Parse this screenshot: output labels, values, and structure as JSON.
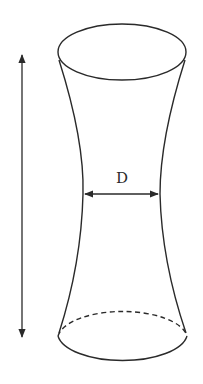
{
  "diagram": {
    "type": "hyperboloid-tube",
    "labels": {
      "waist_diameter": "D"
    },
    "colors": {
      "stroke": "#2a2a2a",
      "background": "#ffffff"
    },
    "shape": {
      "top_ellipse": {
        "cx": 122,
        "cy": 52,
        "rx": 64,
        "ry": 28
      },
      "bottom_ellipse": {
        "cx": 122,
        "cy": 338,
        "rx": 65,
        "ry": 28,
        "back_half": "dashed"
      },
      "waist": {
        "y": 194,
        "x_left": 83,
        "x_right": 160
      }
    },
    "arrows": {
      "height_arrow": {
        "x": 22,
        "y_top": 55,
        "y_bottom": 337,
        "direction": "double"
      },
      "diameter_arrow": {
        "y": 194,
        "x_left": 84,
        "x_right": 159,
        "direction": "double"
      }
    }
  }
}
